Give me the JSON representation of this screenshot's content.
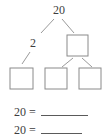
{
  "worksheet": {
    "type": "number-bond-diagram",
    "number_bond": {
      "root": {
        "value": "20",
        "filled": true
      },
      "level_two": [
        {
          "value": "2",
          "filled": true,
          "shape": "text"
        },
        {
          "value": "",
          "filled": false,
          "shape": "box"
        }
      ],
      "level_three": [
        {
          "value": "",
          "filled": false,
          "shape": "box",
          "parent": "2"
        },
        {
          "value": "",
          "filled": false,
          "shape": "box",
          "parent": "box"
        },
        {
          "value": "",
          "filled": false,
          "shape": "box",
          "parent": "box"
        }
      ]
    },
    "equations": [
      {
        "left": "20  =",
        "answer": "",
        "blank_style": "long"
      },
      {
        "left": "20  =",
        "answer": "",
        "blank_style": "short"
      }
    ]
  },
  "colors": {
    "ink": "#3d3d3d",
    "box_stroke": "#8a8a8a",
    "line_stroke": "#9a9a9a",
    "rule": "#5a5a5a",
    "background": "#ffffff"
  }
}
